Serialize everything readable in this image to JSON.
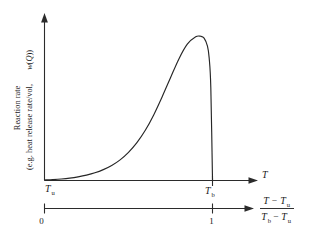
{
  "figure": {
    "background_color": "#ffffff",
    "line_color": "#262626",
    "axis_color": "#2b2b2b"
  },
  "y_axis": {
    "label_line1": "Reaction rate",
    "label_line2_prefix": "(e.g. heat release rate/vol, ",
    "label_line2_symbol": "w",
    "label_line2_paren_open": "(",
    "label_line2_symbol2": "Q",
    "label_line2_suffix": "))"
  },
  "x_axis_upper": {
    "label": "T",
    "ticks": [
      {
        "symbol": "T",
        "subscript": "u"
      },
      {
        "symbol": "T",
        "subscript": "b"
      }
    ]
  },
  "x_axis_lower": {
    "ticks": [
      "0",
      "1"
    ],
    "fraction": {
      "numerator_a": "T",
      "numerator_minus": "−",
      "numerator_b": "T",
      "numerator_b_sub": "u",
      "denominator_a": "T",
      "denominator_a_sub": "b",
      "denominator_minus": "−",
      "denominator_b": "T",
      "denominator_b_sub": "u"
    }
  },
  "chart_data": {
    "type": "line",
    "title": "",
    "xlabel": "T",
    "ylabel": "Reaction rate (e.g. heat release rate/vol, w(Q))",
    "xlim": [
      0,
      1
    ],
    "ylim": [
      0,
      1
    ],
    "grid": false,
    "legend": null,
    "annotations": [
      {
        "text": "T_u",
        "x": 0,
        "y": 0
      },
      {
        "text": "T_b",
        "x": 1,
        "y": 0
      },
      {
        "text": "0",
        "x": 0,
        "y": 0
      },
      {
        "text": "1",
        "x": 1,
        "y": 0
      }
    ],
    "series": [
      {
        "name": "reaction rate",
        "x": [
          0.0,
          0.05,
          0.1,
          0.15,
          0.2,
          0.25,
          0.3,
          0.35,
          0.4,
          0.45,
          0.5,
          0.55,
          0.6,
          0.65,
          0.7,
          0.75,
          0.8,
          0.85,
          0.9,
          0.93,
          0.95,
          0.97,
          0.98,
          0.99,
          1.0
        ],
        "y": [
          0.0,
          0.003,
          0.007,
          0.013,
          0.022,
          0.034,
          0.05,
          0.072,
          0.101,
          0.14,
          0.192,
          0.259,
          0.345,
          0.452,
          0.577,
          0.71,
          0.841,
          0.943,
          0.995,
          0.998,
          0.985,
          0.93,
          0.85,
          0.64,
          0.0
        ]
      }
    ]
  }
}
